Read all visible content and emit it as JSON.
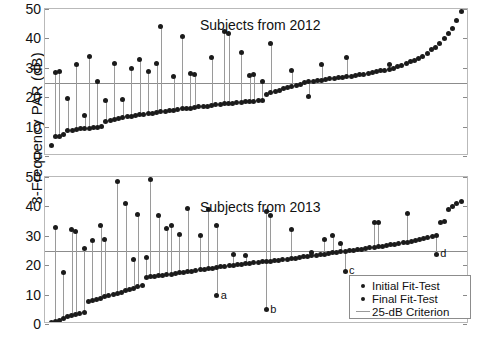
{
  "axis": {
    "ylabel": "3-Frequency PAR (dB)",
    "yticks": [
      0,
      10,
      20,
      30,
      40,
      50
    ],
    "ylim": [
      0,
      50
    ]
  },
  "legend": {
    "items": [
      {
        "label": "Initial Fit-Test",
        "symbol": "dot"
      },
      {
        "label": "Final Fit-Test",
        "symbol": "dot"
      },
      {
        "label": "25-dB Criterion",
        "symbol": "line"
      }
    ]
  },
  "criterion": {
    "value": 25,
    "label": "25-dB Criterion",
    "color": "#8c8c8c"
  },
  "colors": {
    "marker": "#1b1b1b",
    "stem": "#9a9a9a",
    "frame": "#b9b9b9"
  },
  "chart_data": [
    {
      "type": "scatter",
      "title": "Subjects from 2012",
      "panel": "top",
      "xlabel": "",
      "ylabel": "3-Frequency PAR (dB)",
      "ylim": [
        0,
        50
      ],
      "grid": false,
      "hline": 25,
      "n": 98,
      "series": [
        {
          "name": "Final Fit-Test",
          "values": [
            3.6,
            6.5,
            6.6,
            7.2,
            8.6,
            8.8,
            9.0,
            9.2,
            9.4,
            9.5,
            9.6,
            9.8,
            10.0,
            11.6,
            12.0,
            12.4,
            12.6,
            13.0,
            13.4,
            13.6,
            13.9,
            14.0,
            14.2,
            14.4,
            14.6,
            14.8,
            15.0,
            15.2,
            15.4,
            15.6,
            15.8,
            16.0,
            16.2,
            16.3,
            16.5,
            16.7,
            16.9,
            17.0,
            17.2,
            17.4,
            17.5,
            17.7,
            17.8,
            18.0,
            18.1,
            18.3,
            18.4,
            18.6,
            18.7,
            18.9,
            19.0,
            21.0,
            21.6,
            22.0,
            22.4,
            22.8,
            23.2,
            23.6,
            24.0,
            24.4,
            25.0,
            25.2,
            25.4,
            25.6,
            25.8,
            26.0,
            26.2,
            26.4,
            26.6,
            26.8,
            27.0,
            27.2,
            27.4,
            27.6,
            27.8,
            28.0,
            28.3,
            28.6,
            29.0,
            29.2,
            29.4,
            29.8,
            30.3,
            30.8,
            31.5,
            32.0,
            32.6,
            33.2,
            34.0,
            35.0,
            36.2,
            37.0,
            38.4,
            40.0,
            41.5,
            43.5,
            46.0,
            49.2
          ]
        },
        {
          "name": "Initial Fit-Test",
          "points": [
            {
              "i": 1,
              "y": 28.4
            },
            {
              "i": 2,
              "y": 28.6
            },
            {
              "i": 4,
              "y": 19.6
            },
            {
              "i": 6,
              "y": 31.2
            },
            {
              "i": 8,
              "y": 13.8
            },
            {
              "i": 9,
              "y": 34.0
            },
            {
              "i": 11,
              "y": 25.4
            },
            {
              "i": 13,
              "y": 18.9
            },
            {
              "i": 15,
              "y": 31.3
            },
            {
              "i": 17,
              "y": 19.3
            },
            {
              "i": 19,
              "y": 29.7
            },
            {
              "i": 21,
              "y": 32.7
            },
            {
              "i": 23,
              "y": 28.8
            },
            {
              "i": 25,
              "y": 31.6
            },
            {
              "i": 26,
              "y": 44.0
            },
            {
              "i": 29,
              "y": 27.0
            },
            {
              "i": 31,
              "y": 40.8
            },
            {
              "i": 33,
              "y": 28.0
            },
            {
              "i": 34,
              "y": 27.8
            },
            {
              "i": 38,
              "y": 33.5
            },
            {
              "i": 41,
              "y": 42.2
            },
            {
              "i": 42,
              "y": 41.6
            },
            {
              "i": 45,
              "y": 35.3
            },
            {
              "i": 47,
              "y": 27.5
            },
            {
              "i": 48,
              "y": 27.6
            },
            {
              "i": 50,
              "y": 25.5
            },
            {
              "i": 52,
              "y": 38.4
            },
            {
              "i": 57,
              "y": 29.0
            },
            {
              "i": 61,
              "y": 20.3
            },
            {
              "i": 64,
              "y": 31.0
            },
            {
              "i": 70,
              "y": 33.5
            },
            {
              "i": 80,
              "y": 31.0
            }
          ]
        }
      ]
    },
    {
      "type": "scatter",
      "title": "Subjects from 2013",
      "panel": "bottom",
      "xlabel": "",
      "ylabel": "3-Frequency PAR (dB)",
      "ylim": [
        0,
        50
      ],
      "grid": false,
      "hline": 25,
      "n": 100,
      "annotations": [
        {
          "text": "a",
          "i": 40,
          "y": 9.6
        },
        {
          "text": "b",
          "i": 52,
          "y": 4.8
        },
        {
          "text": "c",
          "i": 71,
          "y": 18.0
        },
        {
          "text": "d",
          "i": 93,
          "y": 23.8
        }
      ],
      "series": [
        {
          "name": "Final Fit-Test",
          "values": [
            0.4,
            0.8,
            1.2,
            1.8,
            2.4,
            2.8,
            3.2,
            3.6,
            3.9,
            7.6,
            8.0,
            8.4,
            8.8,
            9.2,
            9.6,
            10.0,
            10.4,
            10.8,
            11.4,
            11.8,
            12.2,
            12.8,
            13.2,
            15.8,
            16.0,
            16.2,
            16.4,
            16.6,
            16.8,
            17.0,
            17.2,
            17.4,
            17.6,
            17.8,
            18.0,
            18.2,
            18.4,
            18.6,
            18.8,
            19.0,
            19.2,
            19.4,
            19.6,
            19.8,
            20.0,
            20.2,
            20.4,
            20.5,
            20.6,
            20.8,
            21.0,
            21.1,
            21.2,
            21.4,
            21.5,
            21.6,
            21.8,
            22.0,
            22.2,
            22.4,
            22.6,
            22.8,
            23.0,
            23.2,
            23.4,
            23.6,
            23.8,
            24.0,
            24.2,
            24.4,
            24.5,
            24.7,
            24.9,
            25.1,
            25.3,
            25.5,
            25.7,
            25.9,
            26.1,
            26.3,
            26.5,
            26.8,
            27.0,
            27.2,
            27.4,
            27.6,
            27.8,
            28.0,
            28.3,
            28.6,
            29.0,
            29.4,
            29.8,
            30.2,
            34.5,
            35.0,
            39.0,
            40.0,
            41.0,
            41.8
          ]
        },
        {
          "name": "Initial Fit-Test",
          "points": [
            {
              "i": 1,
              "y": 32.8
            },
            {
              "i": 3,
              "y": 17.4
            },
            {
              "i": 5,
              "y": 32.0
            },
            {
              "i": 6,
              "y": 31.5
            },
            {
              "i": 8,
              "y": 25.8
            },
            {
              "i": 10,
              "y": 28.4
            },
            {
              "i": 12,
              "y": 33.4
            },
            {
              "i": 13,
              "y": 28.6
            },
            {
              "i": 16,
              "y": 48.4
            },
            {
              "i": 18,
              "y": 41.0
            },
            {
              "i": 20,
              "y": 22.0
            },
            {
              "i": 21,
              "y": 37.2
            },
            {
              "i": 23,
              "y": 22.7
            },
            {
              "i": 24,
              "y": 49.2
            },
            {
              "i": 26,
              "y": 36.8
            },
            {
              "i": 28,
              "y": 32.4
            },
            {
              "i": 29,
              "y": 33.4
            },
            {
              "i": 31,
              "y": 30.6
            },
            {
              "i": 33,
              "y": 39.2
            },
            {
              "i": 36,
              "y": 30.2
            },
            {
              "i": 38,
              "y": 39.0
            },
            {
              "i": 40,
              "y": 33.4
            },
            {
              "i": 44,
              "y": 23.8
            },
            {
              "i": 47,
              "y": 23.3
            },
            {
              "i": 52,
              "y": 38.2
            },
            {
              "i": 53,
              "y": 37.0
            },
            {
              "i": 58,
              "y": 32.2
            },
            {
              "i": 63,
              "y": 24.4
            },
            {
              "i": 66,
              "y": 28.8
            },
            {
              "i": 68,
              "y": 30.0
            },
            {
              "i": 70,
              "y": 27.4
            },
            {
              "i": 78,
              "y": 34.6
            },
            {
              "i": 79,
              "y": 34.6
            },
            {
              "i": 86,
              "y": 37.5
            }
          ]
        }
      ]
    }
  ]
}
